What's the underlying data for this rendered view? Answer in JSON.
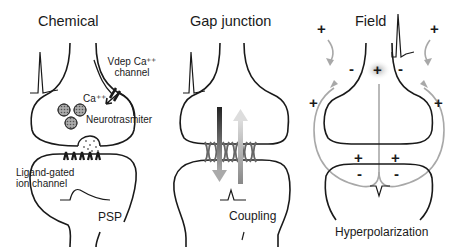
{
  "panels": [
    {
      "title": "Chemical",
      "labels": {
        "vdep_channel_line1": "Vdep Ca⁺⁺",
        "vdep_channel_line2": "channel",
        "calcium": "Ca⁺⁺",
        "neurotransmitter": "Neurotrasmiter",
        "ligand_line1": "Ligand-gated",
        "ligand_line2": "ion channel",
        "response": "PSP"
      }
    },
    {
      "title": "Gap junction",
      "labels": {
        "response": "Coupling"
      }
    },
    {
      "title": "Field",
      "labels": {
        "response": "Hyperpolarization"
      },
      "signs": {
        "plus": "+",
        "minus": "-"
      }
    }
  ]
}
